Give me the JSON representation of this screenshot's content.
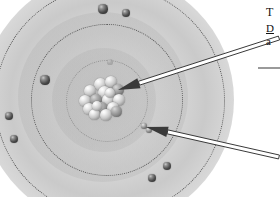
{
  "figure": {
    "name": "atom-structure-diagram",
    "style": "grayscale textbook illustration",
    "background_color": "#ffffff",
    "cloud_color": "#808080",
    "orbit_color": "#565656",
    "electron_color": "#222222",
    "nucleon_color": "#c6c6c6",
    "arrow_color": "#3a3a3a"
  },
  "nucleus": {
    "label": "nucleus",
    "nucleon_count": 17
  },
  "orbits": [
    {
      "name": "outer-orbit",
      "style": "dotted"
    },
    {
      "name": "middle-orbit",
      "style": "dotted"
    },
    {
      "name": "inner-orbit",
      "style": "dotted"
    }
  ],
  "electrons": [
    {
      "name": "electron-outer-top-left",
      "x": 103,
      "y": 9,
      "r": 4.6,
      "ring": "outer"
    },
    {
      "name": "electron-outer-top-right",
      "x": 126,
      "y": 13,
      "r": 4.4,
      "ring": "outer"
    },
    {
      "name": "electron-outer-mid-left",
      "x": 45,
      "y": 80,
      "r": 4.6,
      "ring": "outer"
    },
    {
      "name": "electron-outer-left-upper",
      "x": 9,
      "y": 116,
      "r": 4.4,
      "ring": "outer"
    },
    {
      "name": "electron-outer-left-lower",
      "x": 14,
      "y": 139,
      "r": 4.4,
      "ring": "outer"
    },
    {
      "name": "electron-outer-bottom",
      "x": 152,
      "y": 178,
      "r": 4.2,
      "ring": "outer"
    },
    {
      "name": "electron-outer-bottom-right",
      "x": 167,
      "y": 166,
      "r": 4.2,
      "ring": "outer"
    },
    {
      "name": "electron-middle-right",
      "x": 149,
      "y": 130,
      "r": 3.2,
      "ring": "middle"
    },
    {
      "name": "electron-middle-pointed",
      "x": 144,
      "y": 126,
      "r": 3.4,
      "ring": "middle"
    },
    {
      "name": "electron-inner-faint",
      "x": 110,
      "y": 62,
      "r": 2.6,
      "ring": "inner"
    }
  ],
  "nucleons": [
    {
      "x": 16,
      "y": 2,
      "d": 13,
      "shade": "light"
    },
    {
      "x": 27,
      "y": 0,
      "d": 12,
      "shade": "light"
    },
    {
      "x": 6,
      "y": 9,
      "d": 12,
      "shade": "light"
    },
    {
      "x": 34,
      "y": 8,
      "d": 12,
      "shade": "dark"
    },
    {
      "x": 20,
      "y": 10,
      "d": 13,
      "shade": "light"
    },
    {
      "x": 1,
      "y": 19,
      "d": 12,
      "shade": "light"
    },
    {
      "x": 12,
      "y": 18,
      "d": 12,
      "shade": "dark"
    },
    {
      "x": 24,
      "y": 18,
      "d": 12,
      "shade": "light"
    },
    {
      "x": 35,
      "y": 18,
      "d": 12,
      "shade": "light"
    },
    {
      "x": 5,
      "y": 27,
      "d": 12,
      "shade": "light"
    },
    {
      "x": 17,
      "y": 26,
      "d": 13,
      "shade": "dark"
    },
    {
      "x": 29,
      "y": 26,
      "d": 12,
      "shade": "light"
    },
    {
      "x": 11,
      "y": 33,
      "d": 11,
      "shade": "light"
    },
    {
      "x": 22,
      "y": 33,
      "d": 12,
      "shade": "light"
    },
    {
      "x": 33,
      "y": 30,
      "d": 11,
      "shade": "dark"
    },
    {
      "x": 27,
      "y": 12,
      "d": 10,
      "shade": "light"
    },
    {
      "x": 14,
      "y": 25,
      "d": 10,
      "shade": "light"
    }
  ],
  "callouts": [
    {
      "name": "callout-nucleus",
      "target": "nucleus",
      "tip_x": 118,
      "tip_y": 90,
      "tail_x": 279,
      "tail_y": 38
    },
    {
      "name": "callout-electron",
      "target": "electron",
      "tip_x": 146,
      "tip_y": 127,
      "tail_x": 279,
      "tail_y": 157
    }
  ],
  "caption": {
    "title": "T",
    "term": "D",
    "body": "a"
  }
}
